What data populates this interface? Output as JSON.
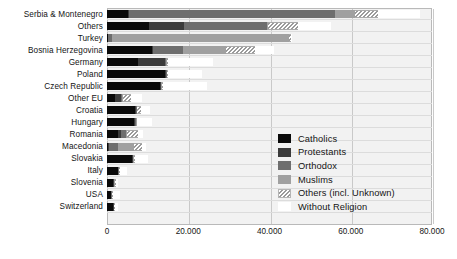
{
  "chart_data": {
    "type": "bar",
    "subtype": "horizontal-stacked",
    "title": "",
    "xlabel": "",
    "ylabel": "",
    "xlim": [
      0,
      80000
    ],
    "xticks": [
      0,
      20000,
      40000,
      60000,
      80000
    ],
    "xtick_labels": [
      "0",
      "20.000",
      "40.000",
      "60.000",
      "80.000"
    ],
    "grid": true,
    "legend_position": "center-right",
    "categories": [
      "Serbia & Montenegro",
      "Others",
      "Turkey",
      "Bosnia Herzegovina",
      "Germany",
      "Poland",
      "Czech Republic",
      "Other EU",
      "Croatia",
      "Hungary",
      "Romania",
      "Macedonia",
      "Slovakia",
      "Italy",
      "Slovenia",
      "USA",
      "Switzerland"
    ],
    "series": [
      {
        "name": "Catholics",
        "color": "#0a0a0a",
        "values": [
          5200,
          10300,
          200,
          11100,
          7700,
          14300,
          13000,
          2000,
          6800,
          6700,
          2600,
          300,
          6100,
          2700,
          1500,
          900,
          1400
        ]
      },
      {
        "name": "Protestants",
        "color": "#3b3b3b",
        "values": [
          200,
          8600,
          100,
          200,
          6600,
          200,
          200,
          1400,
          300,
          300,
          900,
          200,
          200,
          100,
          200,
          200,
          200
        ]
      },
      {
        "name": "Orthodox",
        "color": "#6e6e6e",
        "values": [
          50800,
          20400,
          900,
          7400,
          200,
          200,
          200,
          400,
          200,
          200,
          1200,
          2200,
          200,
          100,
          100,
          100,
          100
        ]
      },
      {
        "name": "Muslims",
        "color": "#a0a0a0",
        "values": [
          4900,
          300,
          43500,
          10500,
          200,
          100,
          100,
          200,
          100,
          100,
          200,
          3900,
          100,
          100,
          100,
          100,
          100
        ]
      },
      {
        "name": "Others  (incl. Unknown)",
        "color": "hatched",
        "values": [
          5700,
          7300,
          600,
          7200,
          300,
          200,
          200,
          2000,
          900,
          200,
          2700,
          2100,
          200,
          100,
          400,
          200,
          200
        ]
      },
      {
        "name": "Without Religion",
        "color": "#ffffff",
        "values": [
          10300,
          8200,
          300,
          4700,
          11100,
          8500,
          10900,
          2600,
          2400,
          3600,
          1300,
          1000,
          3300,
          1700,
          400,
          1800,
          700
        ]
      }
    ]
  },
  "legend": {
    "items": [
      {
        "label": "Catholics",
        "key": "catholics"
      },
      {
        "label": "Protestants",
        "key": "protestants"
      },
      {
        "label": "Orthodox",
        "key": "orthodox"
      },
      {
        "label": "Muslims",
        "key": "muslims"
      },
      {
        "label": "Others  (incl. Unknown)",
        "key": "others"
      },
      {
        "label": "Without Religion",
        "key": "norelig"
      }
    ]
  }
}
